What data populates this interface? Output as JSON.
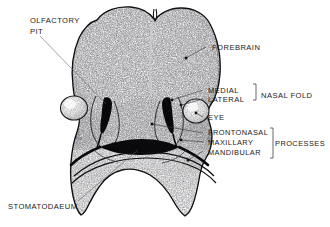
{
  "figure": {
    "background_color": "#ffffff",
    "ink_color": "#1a1a1a",
    "drawing_style": "stippled pen-and-ink anatomical illustration"
  },
  "labels": {
    "olfactory_pit_line1": "OLFACTORY",
    "olfactory_pit_line2": "PIT",
    "forebrain": "FOREBRAIN",
    "medial": "MEDIAL",
    "lateral": "LATERAL",
    "nasal_fold": "NASAL FOLD",
    "eye": "EYE",
    "frontonasal": "FRONTONASAL",
    "maxillary": "MAXILLARY",
    "mandibular": "MANDIBULAR",
    "processes": "PROCESSES",
    "stomatodaeum": "STOMATODAEUM"
  },
  "structures": [
    {
      "name": "forebrain",
      "label": "FOREBRAIN",
      "side": "midline",
      "description": "large bilobed prosencephalic prominence forming the upper head"
    },
    {
      "name": "olfactory-pit",
      "label": "OLFACTORY PIT",
      "side": "left",
      "description": "dark nasal pit depression"
    },
    {
      "name": "medial-nasal-fold",
      "label": "MEDIAL",
      "group": "NASAL FOLD",
      "side": "bilateral"
    },
    {
      "name": "lateral-nasal-fold",
      "label": "LATERAL",
      "group": "NASAL FOLD",
      "side": "bilateral"
    },
    {
      "name": "eye",
      "label": "EYE",
      "side": "bilateral",
      "description": "rounded optic vesicle bulge lateral to nasal fold"
    },
    {
      "name": "frontonasal-process",
      "label": "FRONTONASAL",
      "group": "PROCESSES"
    },
    {
      "name": "maxillary-process",
      "label": "MAXILLARY",
      "group": "PROCESSES"
    },
    {
      "name": "mandibular-process",
      "label": "MANDIBULAR",
      "group": "PROCESSES"
    },
    {
      "name": "stomatodaeum",
      "label": "STOMATODAEUM",
      "side": "midline",
      "description": "primitive mouth slit beneath the maxillary-mandibular junction"
    }
  ],
  "brackets": [
    {
      "name": "nasal-fold-bracket",
      "members": [
        "MEDIAL",
        "LATERAL"
      ],
      "label": "NASAL FOLD"
    },
    {
      "name": "processes-bracket",
      "members": [
        "FRONTONASAL",
        "MAXILLARY",
        "MANDIBULAR"
      ],
      "label": "PROCESSES"
    }
  ]
}
